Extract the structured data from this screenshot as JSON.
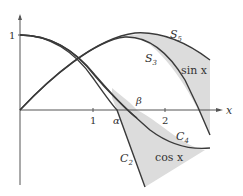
{
  "figure": {
    "axes": {
      "x_label": "x",
      "y_tick_label": "1",
      "x_tick_labels": [
        "1",
        "2"
      ]
    },
    "points": {
      "alpha": "α",
      "beta": "β"
    },
    "curves": {
      "S5": {
        "label_main": "S",
        "label_sub": "5"
      },
      "S3": {
        "label_main": "S",
        "label_sub": "3"
      },
      "C4": {
        "label_main": "C",
        "label_sub": "4"
      },
      "C2": {
        "label_main": "C",
        "label_sub": "2"
      }
    },
    "regions": {
      "sin": "sin x",
      "cos": "cos x"
    },
    "colors": {
      "curve": "#3a3a3a",
      "axis": "#555555",
      "shade": "#d9d9d9"
    }
  }
}
